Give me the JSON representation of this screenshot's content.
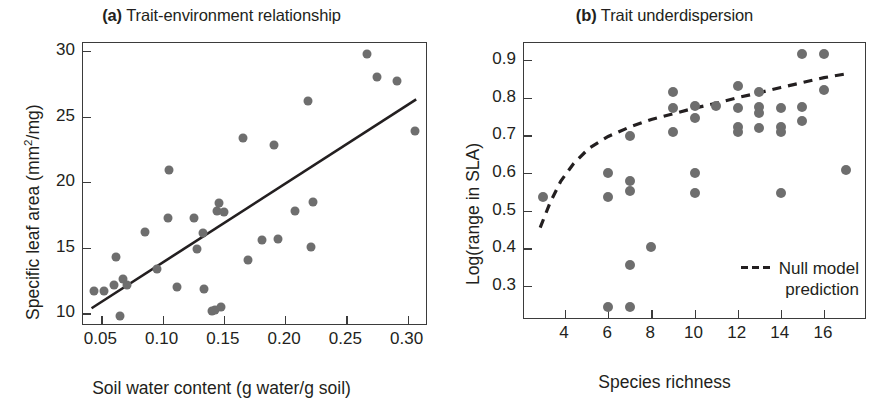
{
  "figure": {
    "background": "#ffffff",
    "marker_color": "#6e6e6e",
    "line_color": "#231f20",
    "axis_color": "#3b3b3b"
  },
  "chart_data": [
    {
      "type": "scatter",
      "panel": "a",
      "tag": "(a)",
      "title": "Trait-environment relationship",
      "xlabel": "Soil water content (g water/g soil)",
      "ylabel": "Specific leaf area (mm2/mg)",
      "ylabel_parts": {
        "pre": "Specific leaf area (mm",
        "sup": "2",
        "post": "/mg)"
      },
      "xlim": [
        0.035,
        0.315
      ],
      "ylim": [
        9.2,
        30.6
      ],
      "xticks": [
        0.05,
        0.1,
        0.15,
        0.2,
        0.25,
        0.3
      ],
      "xticklabels": [
        "0.05",
        "0.10",
        "0.15",
        "0.20",
        "0.25",
        "0.30"
      ],
      "yticks": [
        10,
        15,
        20,
        25,
        30
      ],
      "yticklabels": [
        "10",
        "15",
        "20",
        "25",
        "30"
      ],
      "grid": false,
      "legend": null,
      "points": [
        {
          "x": 0.044,
          "y": 11.7
        },
        {
          "x": 0.052,
          "y": 11.7
        },
        {
          "x": 0.06,
          "y": 12.2
        },
        {
          "x": 0.062,
          "y": 14.3
        },
        {
          "x": 0.065,
          "y": 9.8
        },
        {
          "x": 0.068,
          "y": 12.6
        },
        {
          "x": 0.071,
          "y": 12.2
        },
        {
          "x": 0.086,
          "y": 16.2
        },
        {
          "x": 0.095,
          "y": 13.4
        },
        {
          "x": 0.104,
          "y": 17.3
        },
        {
          "x": 0.105,
          "y": 20.9
        },
        {
          "x": 0.112,
          "y": 12.0
        },
        {
          "x": 0.126,
          "y": 17.3
        },
        {
          "x": 0.128,
          "y": 14.9
        },
        {
          "x": 0.133,
          "y": 16.1
        },
        {
          "x": 0.134,
          "y": 11.9
        },
        {
          "x": 0.14,
          "y": 10.2
        },
        {
          "x": 0.143,
          "y": 10.3
        },
        {
          "x": 0.144,
          "y": 17.8
        },
        {
          "x": 0.146,
          "y": 18.4
        },
        {
          "x": 0.148,
          "y": 10.5
        },
        {
          "x": 0.15,
          "y": 17.7
        },
        {
          "x": 0.166,
          "y": 23.4
        },
        {
          "x": 0.17,
          "y": 14.1
        },
        {
          "x": 0.181,
          "y": 15.6
        },
        {
          "x": 0.191,
          "y": 22.8
        },
        {
          "x": 0.194,
          "y": 15.7
        },
        {
          "x": 0.208,
          "y": 17.8
        },
        {
          "x": 0.219,
          "y": 26.2
        },
        {
          "x": 0.221,
          "y": 15.1
        },
        {
          "x": 0.223,
          "y": 18.5
        },
        {
          "x": 0.267,
          "y": 29.8
        },
        {
          "x": 0.275,
          "y": 28.0
        },
        {
          "x": 0.291,
          "y": 27.7
        },
        {
          "x": 0.306,
          "y": 23.9
        }
      ],
      "trend_line": {
        "style": "solid",
        "x0": 0.042,
        "y0": 10.4,
        "x1": 0.307,
        "y1": 26.3
      }
    },
    {
      "type": "scatter",
      "panel": "b",
      "tag": "(b)",
      "title": "Trait underdispersion",
      "xlabel": "Species richness",
      "ylabel": "Log(range in SLA)",
      "xlim": [
        2.1,
        17.9
      ],
      "ylim": [
        0.215,
        0.945
      ],
      "xticks": [
        4,
        6,
        8,
        10,
        12,
        14,
        16
      ],
      "xticklabels": [
        "4",
        "6",
        "8",
        "10",
        "12",
        "14",
        "16"
      ],
      "yticks": [
        0.3,
        0.4,
        0.5,
        0.6,
        0.7,
        0.8,
        0.9
      ],
      "yticklabels": [
        "0.3",
        "0.4",
        "0.5",
        "0.6",
        "0.7",
        "0.8",
        "0.9"
      ],
      "grid": false,
      "legend": {
        "position": "lower-right",
        "label": "Null model\nprediction",
        "style": "dashed"
      },
      "points": [
        {
          "x": 3.0,
          "y": 0.535
        },
        {
          "x": 6.0,
          "y": 0.6
        },
        {
          "x": 6.0,
          "y": 0.537
        },
        {
          "x": 6.0,
          "y": 0.243
        },
        {
          "x": 7.0,
          "y": 0.697
        },
        {
          "x": 7.0,
          "y": 0.578
        },
        {
          "x": 7.0,
          "y": 0.552
        },
        {
          "x": 7.0,
          "y": 0.357
        },
        {
          "x": 7.0,
          "y": 0.243
        },
        {
          "x": 8.0,
          "y": 0.403
        },
        {
          "x": 9.0,
          "y": 0.816
        },
        {
          "x": 9.0,
          "y": 0.773
        },
        {
          "x": 9.0,
          "y": 0.709
        },
        {
          "x": 10.0,
          "y": 0.779
        },
        {
          "x": 10.0,
          "y": 0.745
        },
        {
          "x": 10.0,
          "y": 0.6
        },
        {
          "x": 10.0,
          "y": 0.548
        },
        {
          "x": 11.0,
          "y": 0.777
        },
        {
          "x": 12.0,
          "y": 0.832
        },
        {
          "x": 12.0,
          "y": 0.772
        },
        {
          "x": 12.0,
          "y": 0.722
        },
        {
          "x": 12.0,
          "y": 0.71
        },
        {
          "x": 13.0,
          "y": 0.816
        },
        {
          "x": 13.0,
          "y": 0.775
        },
        {
          "x": 13.0,
          "y": 0.76
        },
        {
          "x": 13.0,
          "y": 0.72
        },
        {
          "x": 14.0,
          "y": 0.772
        },
        {
          "x": 14.0,
          "y": 0.722
        },
        {
          "x": 14.0,
          "y": 0.71
        },
        {
          "x": 14.0,
          "y": 0.548
        },
        {
          "x": 15.0,
          "y": 0.916
        },
        {
          "x": 15.0,
          "y": 0.775
        },
        {
          "x": 15.0,
          "y": 0.737
        },
        {
          "x": 16.0,
          "y": 0.916
        },
        {
          "x": 16.0,
          "y": 0.82
        },
        {
          "x": 17.0,
          "y": 0.607
        }
      ],
      "null_model_curve": [
        {
          "x": 2.85,
          "y": 0.455
        },
        {
          "x": 3.3,
          "y": 0.52
        },
        {
          "x": 3.8,
          "y": 0.578
        },
        {
          "x": 4.4,
          "y": 0.625
        },
        {
          "x": 5.1,
          "y": 0.665
        },
        {
          "x": 6.0,
          "y": 0.697
        },
        {
          "x": 7.0,
          "y": 0.722
        },
        {
          "x": 8.0,
          "y": 0.742
        },
        {
          "x": 9.0,
          "y": 0.757
        },
        {
          "x": 10.0,
          "y": 0.772
        },
        {
          "x": 11.0,
          "y": 0.785
        },
        {
          "x": 12.0,
          "y": 0.8
        },
        {
          "x": 13.0,
          "y": 0.813
        },
        {
          "x": 14.0,
          "y": 0.827
        },
        {
          "x": 15.0,
          "y": 0.84
        },
        {
          "x": 16.0,
          "y": 0.853
        },
        {
          "x": 17.1,
          "y": 0.864
        }
      ]
    }
  ]
}
